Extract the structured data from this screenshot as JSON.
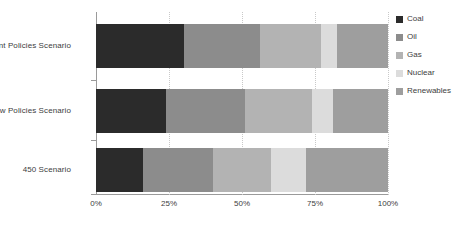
{
  "chart_data": {
    "type": "bar",
    "orientation": "horizontal",
    "stacked": true,
    "normalized": "100%",
    "title": "",
    "subtitle": "",
    "xlabel": "",
    "ylabel": "",
    "xlim": [
      0,
      100
    ],
    "grid": true,
    "grid_axis": "x",
    "legend_position": "right",
    "categories": [
      "Current Policies Scenario",
      "New Policies Scenario",
      "450 Scenario"
    ],
    "tick_labels": [
      "0%",
      "25%",
      "50%",
      "75%",
      "100%"
    ],
    "tick_values": [
      0,
      25,
      50,
      75,
      100
    ],
    "series": [
      {
        "name": "Coal",
        "color": "#2b2b2b",
        "values": [
          30,
          24,
          16
        ]
      },
      {
        "name": "Oil",
        "color": "#8c8c8c",
        "values": [
          26,
          27,
          24
        ]
      },
      {
        "name": "Gas",
        "color": "#b3b3b3",
        "values": [
          21,
          23,
          20
        ]
      },
      {
        "name": "Nuclear",
        "color": "#dcdcdc",
        "values": [
          5.5,
          7,
          12
        ]
      },
      {
        "name": "Renewables",
        "color": "#9e9e9e",
        "values": [
          17.5,
          19,
          28
        ]
      }
    ]
  },
  "axis": {
    "line_color": "#9a9a9a",
    "gridline_color": "#c9c9c9"
  },
  "legend": {
    "entries": [
      {
        "label": "Coal",
        "color": "#2b2b2b"
      },
      {
        "label": "Oil",
        "color": "#8c8c8c"
      },
      {
        "label": "Gas",
        "color": "#b3b3b3"
      },
      {
        "label": "Nuclear",
        "color": "#dcdcdc"
      },
      {
        "label": "Renewables",
        "color": "#9e9e9e"
      }
    ]
  }
}
